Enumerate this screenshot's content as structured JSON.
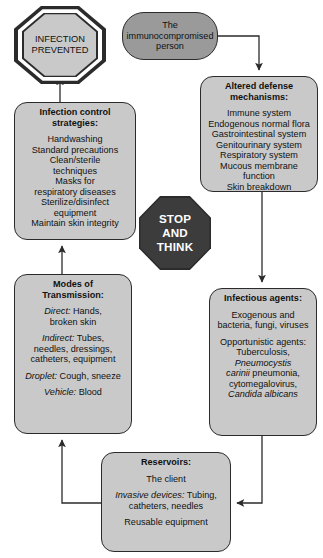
{
  "diagram": {
    "nodes": {
      "infection_prevented": {
        "id": "infection-prevented",
        "shape": "octagon",
        "lines": [
          "INFECTION",
          "PREVENTED"
        ]
      },
      "stop_and_think": {
        "id": "stop-and-think",
        "shape": "octagon-solid",
        "lines": [
          "STOP",
          "AND",
          "THINK"
        ]
      },
      "immunocompromised_person": {
        "id": "immunocompromised-person",
        "shape": "stadium",
        "lines": [
          "The",
          "immunocompromised",
          "person"
        ]
      },
      "altered_defense": {
        "id": "altered-defense-mechanisms",
        "shape": "rounded-box",
        "header": [
          "Altered defense",
          "mechanisms:"
        ],
        "body": [
          "Immune system",
          "Endogenous normal flora",
          "Gastrointestinal system",
          "Genitourinary system",
          "Respiratory system",
          "Mucous membrane",
          "function",
          "Skin breakdown"
        ]
      },
      "infection_control": {
        "id": "infection-control-strategies",
        "shape": "rounded-box",
        "header": [
          "Infection control",
          "strategies:"
        ],
        "body": [
          "Handwashing",
          "Standard precautions",
          "Clean/sterile",
          "techniques",
          "Masks for",
          "respiratory diseases",
          "Sterilize/disinfect",
          "equipment",
          "Maintain skin integrity"
        ]
      },
      "modes_of_transmission": {
        "id": "modes-of-transmission",
        "shape": "rounded-box",
        "header": [
          "Modes of",
          "Transmission:"
        ],
        "entries": [
          {
            "label": "Direct:",
            "text": " Hands,",
            "cont": [
              "broken skin"
            ]
          },
          {
            "label": "Indirect:",
            "text": " Tubes,",
            "cont": [
              "needles, dressings,",
              "catheters, equipment"
            ]
          },
          {
            "label": "Droplet:",
            "text": " Cough, sneeze",
            "cont": []
          },
          {
            "label": "Vehicle:",
            "text": " Blood",
            "cont": []
          }
        ]
      },
      "infectious_agents": {
        "id": "infectious-agents",
        "shape": "rounded-box",
        "header": [
          "Infectious agents:"
        ],
        "group1": [
          "Exogenous and",
          "bacteria, fungi, viruses"
        ],
        "group2_intro": [
          "Opportunistic agents:",
          "Tuberculosis,"
        ],
        "group2_italic_1": "Pneumocystis",
        "group2_mixed_2_italic": "carinii",
        "group2_mixed_2_rest": " pneumonia,",
        "group2_plain_3": "cytomegalovirus,",
        "group2_italic_4": "Candida albicans"
      },
      "reservoirs": {
        "id": "reservoirs",
        "shape": "rounded-box",
        "header": [
          "Reservoirs:"
        ],
        "line_client": "The client",
        "invasive_label": "Invasive devices:",
        "invasive_text": " Tubing,",
        "invasive_cont": "catheters, needles",
        "line_reusable": "Reusable equipment"
      }
    },
    "edges": [
      {
        "from": "immunocompromised-person",
        "to": "altered-defense-mechanisms",
        "style": "elbow-right-down",
        "arrow": true
      },
      {
        "from": "altered-defense-mechanisms",
        "to": "infectious-agents",
        "style": "straight-down",
        "arrow": true
      },
      {
        "from": "infectious-agents",
        "to": "reservoirs",
        "style": "elbow-down-left",
        "arrow": true
      },
      {
        "from": "reservoirs",
        "to": "modes-of-transmission",
        "style": "elbow-left-up",
        "arrow": true
      },
      {
        "from": "modes-of-transmission",
        "to": "infection-control-strategies",
        "style": "straight-up",
        "arrow": true
      },
      {
        "from": "infection-control-strategies",
        "to": "infection-prevented",
        "style": "straight-up",
        "arrow": true
      }
    ],
    "colors": {
      "node_fill": "#c9c9c9",
      "node_fill_dark": "#9a9a9a",
      "stroke": "#2b2b2b",
      "stop_fill": "#3c3c3c",
      "stop_text": "#ffffff",
      "background": "#ffffff"
    }
  }
}
